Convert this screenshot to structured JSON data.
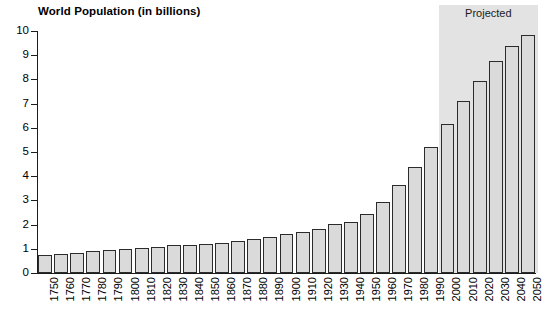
{
  "chart_data": {
    "type": "bar",
    "title": "World Population (in billions)",
    "xlabel": "",
    "ylabel": "",
    "ylim": [
      0,
      10
    ],
    "ytick_values": [
      0,
      1,
      2,
      3,
      4,
      5,
      6,
      7,
      8,
      9,
      10
    ],
    "ytick_labels": [
      "0",
      "1",
      "2",
      "3",
      "4",
      "5",
      "6",
      "7",
      "8",
      "9",
      "10"
    ],
    "grid": false,
    "legend": null,
    "categories": [
      "1750",
      "1760",
      "1770",
      "1780",
      "1790",
      "1800",
      "1810",
      "1820",
      "1830",
      "1840",
      "1850",
      "1860",
      "1870",
      "1880",
      "1890",
      "1900",
      "1910",
      "1920",
      "1930",
      "1940",
      "1950",
      "1960",
      "1970",
      "1980",
      "1990",
      "2000",
      "2010",
      "2020",
      "2030",
      "2040",
      "2050"
    ],
    "values": [
      0.75,
      0.79,
      0.84,
      0.89,
      0.94,
      0.99,
      1.04,
      1.09,
      1.14,
      1.15,
      1.18,
      1.23,
      1.33,
      1.39,
      1.49,
      1.61,
      1.71,
      1.82,
      2.02,
      2.11,
      2.43,
      2.94,
      3.62,
      4.39,
      5.2,
      6.17,
      7.1,
      7.94,
      8.77,
      9.39,
      9.85
    ],
    "annotations": [
      {
        "text": "Projected",
        "start_category": "2000",
        "end_category": "2050",
        "shaded": true,
        "shade_color": "#e3e3e3"
      }
    ],
    "bar_fill_color": "#dadada",
    "bar_edge_color": "#2b2b2b",
    "axis_color": "#1c1c1c",
    "background_color": "#ffffff"
  }
}
